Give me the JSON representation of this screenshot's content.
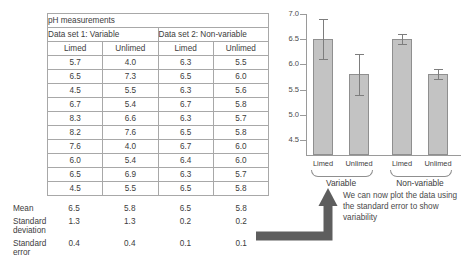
{
  "table": {
    "title": "pH measurements",
    "dataset_headers": [
      "Data set 1: Variable",
      "Data set 2: Non-variable"
    ],
    "column_headers": [
      "Limed",
      "Unlimed",
      "Limed",
      "Unlimed"
    ],
    "rows": [
      [
        "5.7",
        "4.0",
        "6.3",
        "5.5"
      ],
      [
        "6.5",
        "7.3",
        "6.5",
        "6.0"
      ],
      [
        "4.5",
        "5.5",
        "6.3",
        "5.6"
      ],
      [
        "6.7",
        "5.4",
        "6.7",
        "5.8"
      ],
      [
        "8.3",
        "6.6",
        "6.3",
        "5.7"
      ],
      [
        "8.2",
        "7.6",
        "6.5",
        "5.8"
      ],
      [
        "7.6",
        "4.0",
        "6.7",
        "6.0"
      ],
      [
        "6.0",
        "5.4",
        "6.4",
        "6.0"
      ],
      [
        "6.5",
        "6.9",
        "6.3",
        "5.7"
      ],
      [
        "4.5",
        "5.5",
        "6.5",
        "5.8"
      ]
    ],
    "stats": [
      {
        "label": "Mean",
        "values": [
          "6.5",
          "5.8",
          "6.5",
          "5.8"
        ]
      },
      {
        "label": "Standard deviation",
        "values": [
          "1.3",
          "1.3",
          "0.2",
          "0.2"
        ]
      },
      {
        "label": "Standard error",
        "values": [
          "0.4",
          "0.4",
          "0.1",
          "0.1"
        ]
      }
    ]
  },
  "chart_data": {
    "type": "bar",
    "title": "",
    "xlabel": "",
    "ylabel": "",
    "categories": [
      "Limed",
      "Unlimed",
      "Limed",
      "Unlimed"
    ],
    "groups": [
      "Variable",
      "Non-variable"
    ],
    "values": [
      6.5,
      5.8,
      6.5,
      5.8
    ],
    "errors": [
      0.4,
      0.4,
      0.1,
      0.1
    ],
    "error_type": "standard error",
    "ylim": [
      4.5,
      7.0
    ],
    "yticks": [
      "7.0",
      "6.5",
      "6.0",
      "5.5",
      "5.0",
      "4.5"
    ],
    "grid": false,
    "legend": "none"
  },
  "annotation": {
    "caption": "We can now plot the data using the standard error to show variability"
  },
  "colors": {
    "bar_fill": "#c3c3c3",
    "bar_stroke": "#8f8f8f",
    "axis": "#9a9a9a",
    "arrow": "#5e5e5e",
    "text": "#3c3c3c"
  }
}
